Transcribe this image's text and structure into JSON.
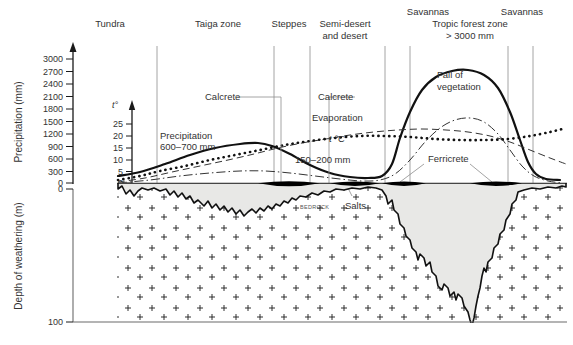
{
  "figure": {
    "type": "diagram"
  },
  "zones": [
    {
      "id": "tundra",
      "label": "Tundra",
      "label2": "",
      "x": 110
    },
    {
      "id": "taiga",
      "label": "Taiga zone",
      "label2": "",
      "x": 218
    },
    {
      "id": "steppes",
      "label": "Steppes",
      "label2": "",
      "x": 289
    },
    {
      "id": "semidesert",
      "label": "Semi-desert",
      "label2": "and desert",
      "x": 345
    },
    {
      "id": "savannas-l",
      "label": "Savannas",
      "label2": "",
      "x": 428
    },
    {
      "id": "tropic",
      "label": "Tropic forest zone",
      "label2": "> 3000 mm",
      "x": 470
    },
    {
      "id": "savannas-r",
      "label": "Savannas",
      "label2": "",
      "x": 522
    }
  ],
  "dividers": [
    157,
    274,
    310,
    385,
    410,
    508,
    533
  ],
  "axes": {
    "precipitation": {
      "label": "Precipitation  (mm)",
      "unit": "mm",
      "ticks": [
        0,
        300,
        600,
        900,
        1200,
        1500,
        1800,
        2100,
        2400,
        2700,
        3000
      ],
      "min": 0,
      "max": 3000
    },
    "temperature": {
      "label": "t°",
      "unit": "°C",
      "ticks": [
        0,
        5,
        10,
        15,
        20,
        25
      ],
      "min": 0,
      "max": 25
    },
    "depth": {
      "label": "Depth of weathering (m)",
      "unit": "m",
      "ticks": [
        0,
        100
      ],
      "min": 0,
      "max": 100
    }
  },
  "annotations": [
    {
      "id": "precipitation",
      "line1": "Precipitation",
      "line2": "600–700 mm"
    },
    {
      "id": "calcrete-left",
      "line1": "Calcrete",
      "line2": ""
    },
    {
      "id": "calcrete-right",
      "line1": "Calcrete",
      "line2": ""
    },
    {
      "id": "evaporation",
      "line1": "Evaporation",
      "line2": ""
    },
    {
      "id": "temp-curve",
      "line1": "t °C",
      "line2": ""
    },
    {
      "id": "precip-arid",
      "line1": "150–200 mm",
      "line2": ""
    },
    {
      "id": "fall-veg",
      "line1": "Fall of",
      "line2": "vegetation"
    },
    {
      "id": "ferricrete",
      "line1": "Ferricrete",
      "line2": ""
    },
    {
      "id": "salts",
      "line1": "Salts",
      "line2": ""
    },
    {
      "id": "bedrock",
      "line1": "BEDROCK",
      "line2": ""
    }
  ],
  "curves": {
    "precipitation": {
      "name": "Precipitation",
      "style": "solid",
      "points": [
        [
          118,
          176
        ],
        [
          140,
          172
        ],
        [
          165,
          164
        ],
        [
          190,
          155
        ],
        [
          215,
          148
        ],
        [
          240,
          144
        ],
        [
          258,
          143
        ],
        [
          272,
          146
        ],
        [
          290,
          154
        ],
        [
          310,
          165
        ],
        [
          330,
          173
        ],
        [
          350,
          177
        ],
        [
          368,
          178
        ],
        [
          382,
          176
        ],
        [
          392,
          164
        ],
        [
          400,
          138
        ],
        [
          410,
          112
        ],
        [
          422,
          90
        ],
        [
          436,
          77
        ],
        [
          452,
          71
        ],
        [
          468,
          70
        ],
        [
          484,
          75
        ],
        [
          498,
          88
        ],
        [
          510,
          112
        ],
        [
          520,
          140
        ],
        [
          528,
          162
        ],
        [
          536,
          174
        ],
        [
          546,
          179
        ],
        [
          560,
          180
        ]
      ]
    },
    "temperature": {
      "name": "t °C",
      "style": "dotted",
      "points": [
        [
          118,
          180
        ],
        [
          140,
          176
        ],
        [
          160,
          171
        ],
        [
          185,
          166
        ],
        [
          210,
          160
        ],
        [
          235,
          155
        ],
        [
          260,
          150
        ],
        [
          285,
          145
        ],
        [
          310,
          141
        ],
        [
          335,
          138
        ],
        [
          360,
          136
        ],
        [
          385,
          136
        ],
        [
          410,
          137
        ],
        [
          435,
          139
        ],
        [
          460,
          140
        ],
        [
          485,
          140
        ],
        [
          508,
          139
        ],
        [
          530,
          136
        ],
        [
          550,
          132
        ],
        [
          566,
          128
        ]
      ]
    },
    "evaporation": {
      "name": "Evaporation",
      "style": "dashed",
      "points": [
        [
          118,
          182
        ],
        [
          145,
          178
        ],
        [
          172,
          172
        ],
        [
          200,
          166
        ],
        [
          228,
          160
        ],
        [
          254,
          154
        ],
        [
          278,
          148
        ],
        [
          302,
          143
        ],
        [
          326,
          139
        ],
        [
          350,
          135
        ],
        [
          374,
          132
        ],
        [
          398,
          130
        ],
        [
          422,
          129
        ],
        [
          446,
          130
        ],
        [
          468,
          132
        ],
        [
          490,
          136
        ],
        [
          510,
          142
        ],
        [
          530,
          150
        ],
        [
          550,
          158
        ],
        [
          566,
          164
        ]
      ]
    },
    "fall_of_vegetation": {
      "name": "Fall of vegetation",
      "style": "dashdot",
      "points": [
        [
          118,
          183
        ],
        [
          150,
          180
        ],
        [
          180,
          176
        ],
        [
          210,
          173
        ],
        [
          240,
          171
        ],
        [
          265,
          171
        ],
        [
          290,
          173
        ],
        [
          315,
          176
        ],
        [
          340,
          179
        ],
        [
          362,
          181
        ],
        [
          380,
          180
        ],
        [
          395,
          174
        ],
        [
          410,
          160
        ],
        [
          425,
          142
        ],
        [
          440,
          128
        ],
        [
          455,
          120
        ],
        [
          470,
          118
        ],
        [
          484,
          122
        ],
        [
          498,
          134
        ],
        [
          510,
          150
        ],
        [
          522,
          166
        ],
        [
          534,
          176
        ],
        [
          548,
          181
        ],
        [
          562,
          183
        ]
      ]
    }
  },
  "ground": {
    "label": "ground-surface",
    "crust_patches": [
      {
        "id": "calcrete-patch-1",
        "x": 258,
        "w": 62,
        "type": "calcrete"
      },
      {
        "id": "calcrete-patch-2",
        "x": 330,
        "w": 50,
        "type": "calcrete"
      },
      {
        "id": "ferricrete-patch-1",
        "x": 382,
        "w": 44,
        "type": "ferricrete"
      },
      {
        "id": "ferricrete-patch-2",
        "x": 470,
        "w": 52,
        "type": "ferricrete"
      }
    ]
  },
  "weathering_profile": {
    "label": "Depth of weathering",
    "outline": "M118,189 L122,186 L126,194 L130,190 L134,196 L138,191 L142,188 L148,190 L154,188 L160,191 L166,189 L170,195 L174,191 L178,197 L182,193 L186,199 L190,196 L194,203 L198,200 L204,206 L208,201 L212,208 L216,204 L220,210 L224,206 L228,212 L232,208 L236,214 L240,210 L244,216 L248,212 L252,209 L256,213 L260,208 L264,211 L268,206 L272,209 L276,204 L280,206 L284,201 L288,203 L292,198 L296,200 L300,196 L306,197 L312,193 L318,195 L324,191 L330,192 L336,189 L344,190 L352,188 L360,189 L368,187 L376,188 L382,190 L386,196 L388,204 L392,200 L394,210 L398,214 L400,224 L404,228 L406,236 L410,240 L412,248 L416,252 L418,260 L420,254 L424,258 L426,266 L430,262 L432,272 L436,276 L438,286 L442,290 L444,284 L448,288 L450,296 L454,292 L456,300 L458,294 L462,298 L464,306 L468,312 L470,320 L472,326 L474,318 L476,306 L478,296 L480,288 L482,276 L484,268 L486,272 L488,262 L492,258 L494,248 L498,244 L500,234 L504,230 L506,220 L510,214 L512,204 L516,200 L518,192 L524,190 L532,188 L540,189 L548,187 L556,188 L562,186 L566,187 L566,183 L118,183 Z"
  },
  "colors": {
    "ink": "#1a1a1a",
    "weathered_fill": "#e8e8e6",
    "crust": "#000000",
    "divider": "#9a9a9a",
    "frame": "#6b6b6b",
    "text": "#333333"
  }
}
